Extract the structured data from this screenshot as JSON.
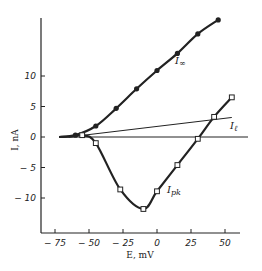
{
  "chart_data": {
    "type": "line",
    "title": "",
    "xlabel": "E, mV",
    "ylabel": "I, nA",
    "xlim": [
      -80,
      60
    ],
    "ylim": [
      -16,
      22
    ],
    "x_ticks": [
      -75,
      -50,
      -25,
      0,
      25,
      50
    ],
    "x_tick_labels": [
      "-75",
      "-50",
      "-25",
      "0",
      "25",
      "50"
    ],
    "y_ticks": [
      -10,
      -5,
      0,
      5,
      10
    ],
    "y_tick_labels": [
      "-10",
      "-5",
      "0",
      "5",
      "10"
    ],
    "grid": false,
    "legend": "inline labels",
    "series": [
      {
        "name": "I∞",
        "marker": "filled-circle",
        "points": [
          [
            -60,
            0.3
          ],
          [
            -45,
            1.8
          ],
          [
            -30,
            4.7
          ],
          [
            -15,
            7.9
          ],
          [
            0,
            10.9
          ],
          [
            15,
            13.7
          ],
          [
            30,
            16.9
          ],
          [
            45,
            19.2
          ]
        ]
      },
      {
        "name": "Il",
        "marker": "none",
        "points": [
          [
            -65,
            0
          ],
          [
            55,
            3.2
          ]
        ]
      },
      {
        "name": "Ipk",
        "marker": "open-square",
        "points": [
          [
            -62,
            0.1
          ],
          [
            -55,
            0.3
          ],
          [
            -45,
            -1.0
          ],
          [
            -27,
            -8.6
          ],
          [
            -10,
            -11.8
          ],
          [
            0,
            -8.9
          ],
          [
            15,
            -4.6
          ],
          [
            30,
            -0.3
          ],
          [
            42,
            3.3
          ],
          [
            55,
            6.5
          ]
        ]
      }
    ],
    "annotations": [
      "I∞",
      "Iℓ",
      "Ipk"
    ]
  },
  "labels": {
    "xlabel": "E, mV",
    "ylabel": "I, nA",
    "series_inf": "I",
    "series_inf_sub": "∞",
    "series_l": "I",
    "series_l_sub": "ℓ",
    "series_pk": "I",
    "series_pk_sub": "pk"
  }
}
